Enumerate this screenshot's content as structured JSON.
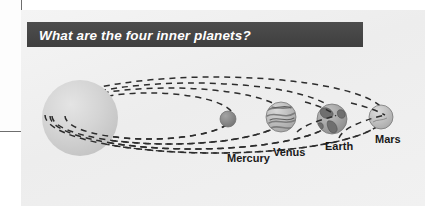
{
  "slide": {
    "title": "What are the four inner planets?",
    "banner_color": "#474747",
    "title_color": "#ffffff",
    "panel_color": "#f2f2f2",
    "page_color": "#ffffff"
  },
  "diagram": {
    "name": "inner-solar-system-diagram",
    "sun": {
      "label": "Sun",
      "color": "#cfcfcf",
      "cx": 59,
      "cy": 108,
      "r": 38
    },
    "orbit": {
      "style": "dashed",
      "color": "#2b2b2b",
      "dash": "6,5",
      "count": 4
    },
    "planets": [
      {
        "name": "Mercury",
        "label": "Mercury",
        "cx": 207,
        "cy": 109,
        "r": 8,
        "color": "#8f8f8f",
        "textured": false,
        "label_x": 206,
        "label_y": 152
      },
      {
        "name": "Venus",
        "label": "Venus",
        "cx": 260,
        "cy": 107,
        "r": 15,
        "color": "#bdbdbd",
        "textured": true,
        "label_x": 252,
        "label_y": 146
      },
      {
        "name": "Earth",
        "label": "Earth",
        "cx": 311,
        "cy": 109,
        "r": 15,
        "color": "#a8a8a8",
        "textured": true,
        "label_x": 304,
        "label_y": 140
      },
      {
        "name": "Mars",
        "label": "Mars",
        "cx": 360,
        "cy": 107,
        "r": 12,
        "color": "#c2c2c2",
        "textured": false,
        "label_x": 354,
        "label_y": 133
      }
    ]
  }
}
